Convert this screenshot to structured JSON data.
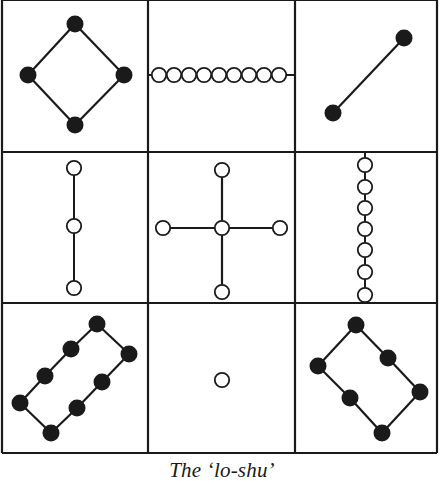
{
  "title": "The ‘lo-shu’",
  "colors": {
    "ink": "#1a1a1a",
    "paper": "#ffffff"
  },
  "grid": {
    "x_lines": [
      2,
      148,
      295,
      437
    ],
    "y_lines": [
      0,
      152,
      303,
      453
    ],
    "line_width": 2.2
  },
  "dot_radius": {
    "filled": 8.5,
    "open": 7.2
  },
  "cells": [
    {
      "row": 0,
      "col": 0,
      "number": 4,
      "kind": "filled",
      "dots": [
        [
          75,
          24
        ],
        [
          28,
          75
        ],
        [
          124,
          75
        ],
        [
          75,
          125
        ]
      ],
      "edges": [
        [
          0,
          1
        ],
        [
          0,
          2
        ],
        [
          1,
          3
        ],
        [
          2,
          3
        ]
      ]
    },
    {
      "row": 0,
      "col": 1,
      "number": 9,
      "kind": "open",
      "dots": [
        [
          159,
          75
        ],
        [
          174,
          75
        ],
        [
          189,
          75
        ],
        [
          204,
          75
        ],
        [
          219,
          75
        ],
        [
          234,
          75
        ],
        [
          249,
          75
        ],
        [
          264,
          75
        ],
        [
          279,
          75
        ]
      ],
      "line": [
        [
          148,
          75
        ],
        [
          295,
          75
        ]
      ]
    },
    {
      "row": 0,
      "col": 2,
      "number": 2,
      "kind": "filled",
      "dots": [
        [
          404,
          38
        ],
        [
          333,
          113
        ]
      ],
      "edges": [
        [
          0,
          1
        ]
      ]
    },
    {
      "row": 1,
      "col": 0,
      "number": 3,
      "kind": "open",
      "dots": [
        [
          74,
          168
        ],
        [
          74,
          226
        ],
        [
          74,
          288
        ]
      ],
      "line": [
        [
          74,
          168
        ],
        [
          74,
          288
        ]
      ]
    },
    {
      "row": 1,
      "col": 1,
      "number": 5,
      "kind": "open",
      "dots": [
        [
          222,
          170
        ],
        [
          163,
          228
        ],
        [
          222,
          228
        ],
        [
          280,
          228
        ],
        [
          222,
          292
        ]
      ],
      "edges": [
        [
          0,
          2
        ],
        [
          1,
          2
        ],
        [
          2,
          3
        ],
        [
          2,
          4
        ]
      ]
    },
    {
      "row": 1,
      "col": 2,
      "number": 7,
      "kind": "open",
      "dots": [
        [
          365,
          165
        ],
        [
          365,
          187
        ],
        [
          365,
          208
        ],
        [
          365,
          229
        ],
        [
          365,
          250
        ],
        [
          365,
          272
        ],
        [
          365,
          295
        ]
      ],
      "line": [
        [
          365,
          152
        ],
        [
          365,
          300
        ]
      ]
    },
    {
      "row": 2,
      "col": 0,
      "number": 8,
      "kind": "filled",
      "dots": [
        [
          97,
          324
        ],
        [
          71,
          349
        ],
        [
          45,
          376
        ],
        [
          20,
          403
        ],
        [
          129,
          354
        ],
        [
          102,
          382
        ],
        [
          77,
          408
        ],
        [
          51,
          433
        ]
      ],
      "edges": [
        [
          0,
          1
        ],
        [
          1,
          2
        ],
        [
          2,
          3
        ],
        [
          0,
          4
        ],
        [
          4,
          5
        ],
        [
          5,
          6
        ],
        [
          6,
          7
        ],
        [
          3,
          7
        ]
      ]
    },
    {
      "row": 2,
      "col": 1,
      "number": 1,
      "kind": "open",
      "dots": [
        [
          222,
          380
        ]
      ],
      "edges": []
    },
    {
      "row": 2,
      "col": 2,
      "number": 6,
      "kind": "filled",
      "dots": [
        [
          356,
          325
        ],
        [
          318,
          366
        ],
        [
          388,
          358
        ],
        [
          350,
          398
        ],
        [
          420,
          392
        ],
        [
          382,
          433
        ]
      ],
      "edges": [
        [
          0,
          1
        ],
        [
          0,
          2
        ],
        [
          2,
          4
        ],
        [
          1,
          3
        ],
        [
          3,
          5
        ],
        [
          4,
          5
        ]
      ]
    }
  ]
}
